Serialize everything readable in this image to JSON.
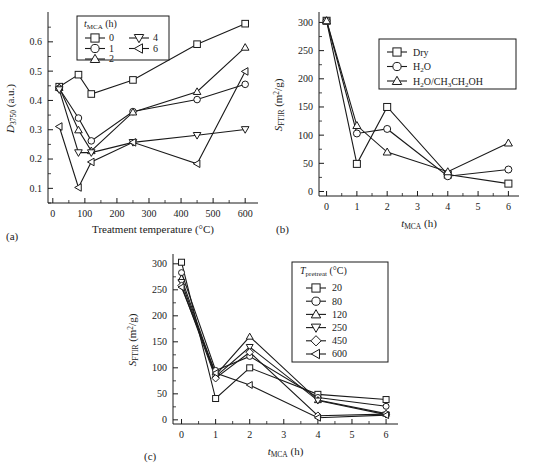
{
  "figure": {
    "panel_a_label": "(a)",
    "panel_b_label": "(b)",
    "panel_c_label": "(c)"
  },
  "chart_data": [
    {
      "id": "a",
      "type": "line",
      "title": "",
      "xlabel": "Treatment temperature (°C)",
      "ylabel": "D3750 (a.u.)",
      "ylabel_parts": {
        "main": "D",
        "sub": "3750",
        "unit": "(a.u.)"
      },
      "legend_title": "tMCA (h)",
      "legend_title_parts": {
        "main": "t",
        "sub": "MCA",
        "unit": "(h)"
      },
      "legend_position": "top-center",
      "grid": false,
      "x": [
        20,
        80,
        120,
        250,
        450,
        600
      ],
      "xticks": [
        0,
        100,
        200,
        300,
        400,
        500,
        600
      ],
      "xlim": [
        -15,
        640
      ],
      "yticks": [
        0.1,
        0.2,
        0.3,
        0.4,
        0.5,
        0.6
      ],
      "ylim": [
        0.05,
        0.695
      ],
      "series": [
        {
          "name": "0",
          "marker": "square",
          "values": [
            0.447,
            0.488,
            0.422,
            0.47,
            0.592,
            0.662
          ]
        },
        {
          "name": "1",
          "marker": "circle",
          "values": [
            0.441,
            0.34,
            0.262,
            0.362,
            0.403,
            0.455
          ]
        },
        {
          "name": "2",
          "marker": "triangle-up",
          "values": [
            0.444,
            0.299,
            0.228,
            0.36,
            0.43,
            0.581
          ]
        },
        {
          "name": "4",
          "marker": "triangle-down",
          "values": [
            0.437,
            0.222,
            0.222,
            0.257,
            0.281,
            0.301
          ]
        },
        {
          "name": "6",
          "marker": "triangle-left",
          "values": [
            0.311,
            0.103,
            0.19,
            0.257,
            0.184,
            0.499
          ]
        }
      ]
    },
    {
      "id": "b",
      "type": "line",
      "title": "",
      "xlabel": "tMCA (h)",
      "xlabel_parts": {
        "main": "t",
        "sub": "MCA",
        "unit": "(h)"
      },
      "ylabel": "SFTIR (m2/g)",
      "ylabel_parts": {
        "main": "S",
        "sub": "FTIR",
        "unit": "(m2/g)"
      },
      "legend_position": "top-right",
      "grid": false,
      "x": [
        0,
        1,
        2,
        4,
        6
      ],
      "xticks": [
        0,
        1,
        2,
        3,
        4,
        5,
        6
      ],
      "xlim": [
        -0.25,
        6.35
      ],
      "yticks": [
        0,
        50,
        100,
        150,
        200,
        250,
        300
      ],
      "ylim": [
        -8,
        315
      ],
      "series": [
        {
          "name": "Dry",
          "marker": "square",
          "values": [
            303,
            49,
            150,
            30,
            14
          ]
        },
        {
          "name": "H2O",
          "marker": "circle",
          "values": [
            303,
            103,
            111,
            27,
            39
          ]
        },
        {
          "name": "H2O/CH3CH2OH",
          "marker": "triangle-up",
          "values": [
            303,
            117,
            70,
            35,
            86
          ]
        }
      ]
    },
    {
      "id": "c",
      "type": "line",
      "title": "",
      "xlabel": "tMCA (h)",
      "xlabel_parts": {
        "main": "t",
        "sub": "MCA",
        "unit": "(h)"
      },
      "ylabel": "SFTIR (m2/g)",
      "ylabel_parts": {
        "main": "S",
        "sub": "FTIR",
        "unit": "(m2/g)"
      },
      "legend_title": "Tpretreat (°C)",
      "legend_title_parts": {
        "main": "T",
        "sub": "pretreat",
        "unit": "(°C)"
      },
      "legend_position": "right",
      "grid": false,
      "x": [
        0,
        1,
        2,
        4,
        6
      ],
      "xticks": [
        0,
        1,
        2,
        3,
        4,
        5,
        6
      ],
      "xlim": [
        -0.25,
        6.35
      ],
      "yticks": [
        0,
        50,
        100,
        150,
        200,
        250,
        300
      ],
      "ylim": [
        -8,
        315
      ],
      "series": [
        {
          "name": "20",
          "marker": "square",
          "values": [
            303,
            41,
            100,
            49,
            39
          ]
        },
        {
          "name": "80",
          "marker": "circle",
          "values": [
            283,
            95,
            122,
            43,
            26
          ]
        },
        {
          "name": "120",
          "marker": "triangle-up",
          "values": [
            272,
            86,
            160,
            38,
            12
          ]
        },
        {
          "name": "250",
          "marker": "triangle-down",
          "values": [
            265,
            83,
            140,
            37,
            10
          ]
        },
        {
          "name": "450",
          "marker": "diamond",
          "values": [
            258,
            80,
            130,
            8,
            11
          ]
        },
        {
          "name": "600",
          "marker": "triangle-left",
          "values": [
            255,
            90,
            67,
            4,
            9
          ]
        }
      ]
    }
  ]
}
